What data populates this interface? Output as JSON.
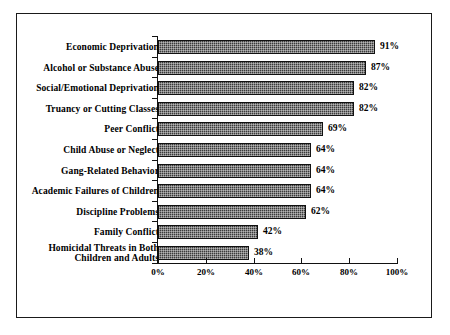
{
  "chart_data": {
    "type": "bar",
    "orientation": "horizontal",
    "title": "",
    "xlabel": "",
    "ylabel": "",
    "xlim": [
      0,
      100
    ],
    "grid": false,
    "legend": null,
    "tick_labels": [
      "0%",
      "20%",
      "40%",
      "60%",
      "80%",
      "100%"
    ],
    "tick_values": [
      0,
      20,
      40,
      60,
      80,
      100
    ],
    "categories": [
      "Economic Deprivation",
      "Alcohol or Substance Abuse",
      "Social/Emotional Deprivation",
      "Truancy or Cutting Classes",
      "Peer Conflict",
      "Child Abuse or Neglect",
      "Gang-Related Behavior",
      "Academic Failures of Children",
      "Discipline Problems",
      "Family Conflict",
      "Homicidal Threats in Both\nChildren and Adults"
    ],
    "values": [
      91,
      87,
      82,
      82,
      69,
      64,
      64,
      64,
      62,
      42,
      38
    ],
    "value_labels": [
      "91%",
      "87%",
      "82%",
      "82%",
      "69%",
      "64%",
      "64%",
      "64%",
      "62%",
      "42%",
      "38%"
    ],
    "bar_color": "#3b3b3b",
    "bar_edge_color": "#111111",
    "axis_color": "#111111",
    "frame_color": "#1a1a1a",
    "background": "#ffffff"
  }
}
